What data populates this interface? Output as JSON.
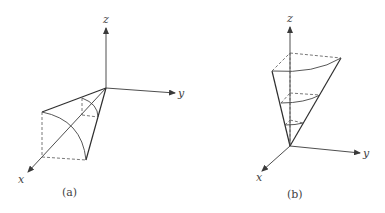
{
  "figure": {
    "panels": [
      {
        "id": "a",
        "caption": "(a)",
        "axes": {
          "x": "x",
          "y": "y",
          "z": "z"
        },
        "description": "Quarter-cone / spherical wedge solid in first octant opening toward x-y, with curved arcs and dashed hidden edges"
      },
      {
        "id": "b",
        "caption": "(b)",
        "axes": {
          "x": "x",
          "y": "y",
          "z": "z"
        },
        "description": "Inverted cone wedge with apex at origin opening upward along z, showing horizontal cross-section arcs at three heights"
      }
    ],
    "colors": {
      "line": "#2e2e2e",
      "background": "#ffffff"
    }
  }
}
